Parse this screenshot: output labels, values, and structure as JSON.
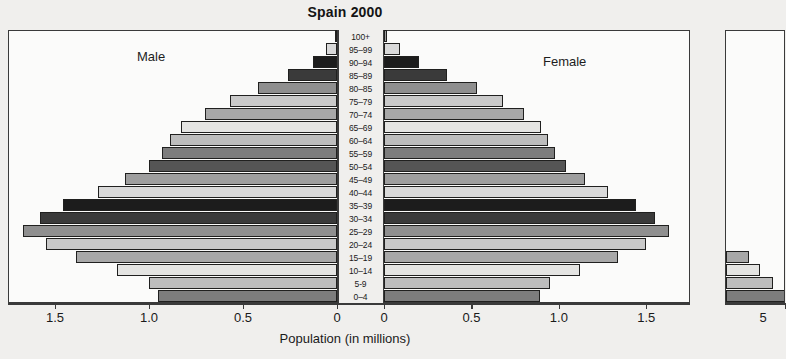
{
  "chart": {
    "title": "Spain 2000",
    "male_label": "Male",
    "female_label": "Female",
    "xaxis_title": "Population (in millions)",
    "male_ticks": [
      "1.5",
      "1.0",
      "0.5",
      "0"
    ],
    "female_ticks": [
      "0",
      "0.5",
      "1.0",
      "1.5"
    ],
    "neighbor_tick": "5"
  },
  "chart_data": {
    "type": "bar",
    "subtype": "population-pyramid",
    "title": "Spain 2000",
    "xlabel": "Population (in millions)",
    "ylabel": "",
    "grid": false,
    "legend": [
      "Male",
      "Female"
    ],
    "xlim_male": [
      0,
      1.75
    ],
    "xlim_female": [
      0,
      1.75
    ],
    "male_tick_values": [
      1.5,
      1.0,
      0.5,
      0
    ],
    "female_tick_values": [
      0,
      0.5,
      1.0,
      1.5
    ],
    "categories": [
      "100+",
      "95–99",
      "90–94",
      "85–89",
      "80–85",
      "75–79",
      "70–74",
      "65–69",
      "60–64",
      "55–59",
      "50–54",
      "45–49",
      "40–44",
      "35–39",
      "30–34",
      "25–29",
      "20–24",
      "15–19",
      "10–14",
      "5-9",
      "0–4"
    ],
    "series": [
      {
        "name": "Male",
        "values": [
          0.01,
          0.06,
          0.13,
          0.26,
          0.42,
          0.57,
          0.7,
          0.83,
          0.89,
          0.93,
          1.0,
          1.13,
          1.27,
          1.46,
          1.58,
          1.67,
          1.55,
          1.39,
          1.17,
          1.0,
          0.95
        ]
      },
      {
        "name": "Female",
        "values": [
          0.02,
          0.09,
          0.2,
          0.36,
          0.53,
          0.68,
          0.8,
          0.9,
          0.94,
          0.98,
          1.04,
          1.15,
          1.28,
          1.44,
          1.55,
          1.63,
          1.5,
          1.34,
          1.12,
          0.95,
          0.89
        ]
      }
    ]
  },
  "neighbor_chart": {
    "type": "bar",
    "subtype": "population-pyramid-partial",
    "bars": [
      {
        "age": "15–19",
        "value": 0.3
      },
      {
        "age": "10–14",
        "value": 0.45
      },
      {
        "age": "5-9",
        "value": 0.62
      },
      {
        "age": "0–4",
        "value": 0.78
      }
    ]
  }
}
